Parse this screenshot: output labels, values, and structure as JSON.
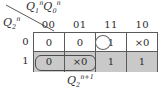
{
  "figure": {
    "type": "karnaugh-map",
    "caption": {
      "base": "Q",
      "sub": "2",
      "sup": "n+1"
    },
    "row_variable": {
      "base": "Q",
      "sub": "2",
      "sup": "n"
    },
    "column_variables": [
      {
        "base": "Q",
        "sub": "1",
        "sup": "n"
      },
      {
        "base": "Q",
        "sub": "0",
        "sup": "n"
      }
    ]
  },
  "table": {
    "column_headers": [
      "00",
      "01",
      "11",
      "10"
    ],
    "row_headers": [
      "0",
      "1"
    ],
    "rows": [
      {
        "label": "0",
        "shaded": false,
        "cells": [
          "0",
          "0",
          "1",
          "×0"
        ]
      },
      {
        "label": "1",
        "shaded": true,
        "cells": [
          "0",
          "×0",
          "1",
          "1"
        ]
      }
    ]
  },
  "groups": [
    {
      "name": "circle-group-row0-col11",
      "shape": "ellipse",
      "covers": "row 0, column 11"
    },
    {
      "name": "rect-group-row1-col00-col01",
      "shape": "rounded-rectangle",
      "covers": "row 1, columns 00 and 01"
    }
  ],
  "colors": {
    "shaded_row": "#c9c9c9",
    "grid_line": "#5a5a5a",
    "text": "#2b2b2b",
    "group_outline": "#4a4a4a"
  }
}
